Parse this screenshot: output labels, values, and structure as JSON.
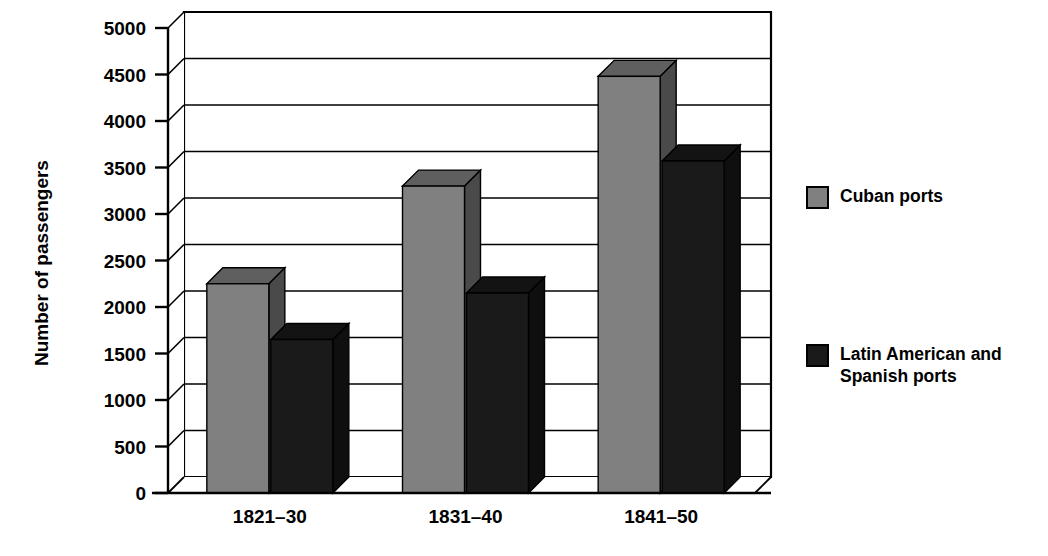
{
  "chart_data": {
    "type": "bar",
    "title": "",
    "subtitle": "",
    "xlabel": "",
    "ylabel": "Number of passengers",
    "categories": [
      "1821–30",
      "1831–40",
      "1841–50"
    ],
    "series": [
      {
        "name": "Cuban ports",
        "values": [
          2250,
          3300,
          4480
        ],
        "color": "#808080"
      },
      {
        "name": "Latin American and Spanish ports",
        "values": [
          1650,
          2150,
          3570
        ],
        "color": "#1a1a1a"
      }
    ],
    "yticks": [
      0,
      500,
      1000,
      1500,
      2000,
      2500,
      3000,
      3500,
      4000,
      4500,
      5000
    ],
    "ytick_labels": [
      "0",
      "500",
      "1000",
      "1500",
      "2000",
      "2500",
      "3000",
      "3500",
      "4000",
      "4500",
      "5000"
    ],
    "ylim": [
      0,
      5000
    ],
    "grid": true,
    "grid_axis": "y",
    "legend_position": "right",
    "style": "3d-grouped-bar",
    "background": "#ffffff",
    "axis_color": "#000000"
  },
  "legend": {
    "entries": [
      {
        "label": "Cuban ports",
        "swatch_color": "#808080"
      },
      {
        "label": "Latin American and Spanish ports",
        "swatch_color": "#1a1a1a"
      }
    ]
  },
  "axes": {
    "y_title": "Number of passengers"
  }
}
